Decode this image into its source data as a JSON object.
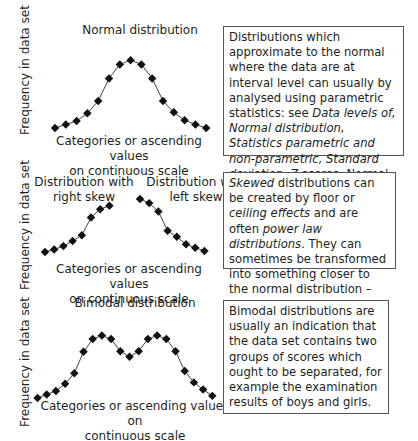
{
  "axis_y_label": "Frequency in data set",
  "panels": [
    {
      "title": "Normal distribution",
      "xlabel_line1": "Categories or ascending values",
      "xlabel_line2": "on continuous scale",
      "description": {
        "segments": [
          {
            "text": "Distributions which approximate to the normal where the data are at interval level can usually by analysed using parametric statistics: see ",
            "italic": false
          },
          {
            "text": "Data levels of, Normal distribution, Statistics parametric and non-parametric, Standard deviation, Z-",
            "italic": true
          },
          {
            "text": "scores",
            "italic": false
          },
          {
            "text": ". Normal distributions are usually created by large numbers of small influences.",
            "italic": false
          }
        ]
      }
    },
    {
      "title_left_line1": "Distribution with",
      "title_left_line2": "right skew",
      "title_right_line1": "Distribution with",
      "title_right_line2": "left skew",
      "xlabel_line1": "Categories or ascending values",
      "xlabel_line2": "on continuous scale",
      "description": {
        "segments": [
          {
            "text": "Skewed",
            "italic": true
          },
          {
            "text": " distributions can be created by floor or ",
            "italic": false
          },
          {
            "text": "ceiling effects",
            "italic": true
          },
          {
            "text": " and are often ",
            "italic": false
          },
          {
            "text": "power law distributions",
            "italic": true
          },
          {
            "text": ". They can sometimes be transformed into something closer to the normal distribution – see ",
            "italic": false
          },
          {
            "text": "Data transformation",
            "italic": true
          },
          {
            "text": ".",
            "italic": false
          }
        ]
      }
    },
    {
      "title": "Bimodal distribution",
      "xlabel_line1": "Categories or ascending values on",
      "xlabel_line2": "continuous scale",
      "description": {
        "segments": [
          {
            "text": "Bimodal distributions are usually an indication that the data set contains two groups of scores which ought to be separated, for example the examination results of boys and girls.",
            "italic": false
          }
        ]
      }
    }
  ],
  "chart_data": [
    {
      "type": "line",
      "title": "Normal distribution",
      "xlabel": "Categories or ascending values on continuous scale",
      "ylabel": "Frequency in data set",
      "x": [
        1,
        2,
        3,
        4,
        5,
        6,
        7,
        8,
        9,
        10,
        11,
        12,
        13,
        14,
        15
      ],
      "values": [
        1,
        1.8,
        2.6,
        4.4,
        7.2,
        12.4,
        15.6,
        16.6,
        15.6,
        12.4,
        7.2,
        4.6,
        2.8,
        1.8,
        1
      ],
      "grid": false
    },
    {
      "type": "line",
      "title": "Distribution with right skew",
      "xlabel": "Categories or ascending values on continuous scale",
      "ylabel": "Frequency in data set",
      "x": [
        1,
        2,
        3,
        4,
        5,
        6,
        7,
        8
      ],
      "values": [
        1,
        1.6,
        2.4,
        3.6,
        5,
        9.2,
        11.2,
        12
      ],
      "grid": false
    },
    {
      "type": "line",
      "title": "Distribution with left skew",
      "xlabel": "Categories or ascending values on continuous scale",
      "ylabel": "Frequency in data set",
      "x": [
        1,
        2,
        3,
        4,
        5,
        6,
        7,
        8
      ],
      "values": [
        13.4,
        12.4,
        10.4,
        5.8,
        4.4,
        2.6,
        1.8,
        1
      ],
      "grid": false
    },
    {
      "type": "line",
      "title": "Bimodal distribution",
      "xlabel": "Categories or ascending values on continuous scale",
      "ylabel": "Frequency in data set",
      "x": [
        1,
        2,
        3,
        4,
        5,
        6,
        7,
        8,
        9,
        10,
        11,
        12,
        13,
        14,
        15,
        16,
        17,
        18,
        19,
        20
      ],
      "values": [
        1,
        2,
        3,
        5,
        8,
        14,
        17.6,
        18.6,
        17.6,
        14.2,
        12.6,
        14.2,
        17.6,
        18.6,
        17.6,
        14.2,
        8.6,
        5.4,
        3.4,
        1.6
      ],
      "grid": false
    }
  ]
}
